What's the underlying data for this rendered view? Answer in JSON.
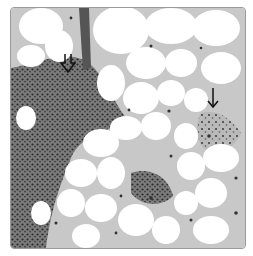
{
  "figure": {
    "type": "histology micrograph",
    "colors": {
      "background": "#ffffff",
      "frame_border": "#9a9a9a",
      "dense_tissue": "#5a5a5a",
      "septa": "#8a8a8a",
      "nuclei": "#2a2a2a",
      "arrow": "#111111"
    }
  },
  "annotations": [
    {
      "id": "open-arrow",
      "style": "open (hollow) downward arrow",
      "position": {
        "x": 67,
        "y": 62
      }
    },
    {
      "id": "thin-arrow",
      "style": "thin solid-line downward arrow",
      "position": {
        "x": 211,
        "y": 90
      }
    }
  ]
}
